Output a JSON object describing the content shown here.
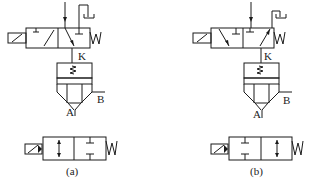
{
  "diagrams": [
    {
      "id": "a",
      "caption": "(a)",
      "labels": {
        "pilot": "K",
        "outlet_a": "A",
        "outlet_b": "B",
        "spring": "W"
      },
      "pilot_valve": "2-position 3-way solenoid pilot valve, de-energized: supply blocked, K vented to exhaust",
      "main_valve": "diaphragm valve",
      "equivalent_symbol": "2/2 solenoid valve, normally open (through-flow in spring position)"
    },
    {
      "id": "b",
      "caption": "(b)",
      "labels": {
        "pilot": "K",
        "outlet_a": "A",
        "outlet_b": "B",
        "spring": "W"
      },
      "pilot_valve": "2-position 3-way solenoid pilot valve, de-energized: supply to K",
      "main_valve": "diaphragm valve",
      "equivalent_symbol": "2/2 solenoid valve, normally closed (blocked in spring position)"
    }
  ],
  "colors": {
    "line": "#1a1a1a",
    "background": "#ffffff"
  }
}
